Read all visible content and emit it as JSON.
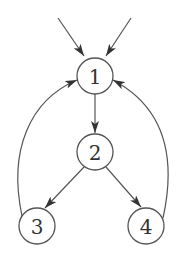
{
  "diagram": {
    "type": "directed-graph",
    "colors": {
      "stroke": "#555555",
      "label": "#333333",
      "background": "#ffffff"
    },
    "nodes": [
      {
        "id": "1",
        "label": "1",
        "x": 95,
        "y": 76
      },
      {
        "id": "2",
        "label": "2",
        "x": 95,
        "y": 152
      },
      {
        "id": "3",
        "label": "3",
        "x": 37,
        "y": 226
      },
      {
        "id": "4",
        "label": "4",
        "x": 146,
        "y": 226
      }
    ],
    "edges": [
      {
        "from": "external-left",
        "to": "1"
      },
      {
        "from": "external-right",
        "to": "1"
      },
      {
        "from": "1",
        "to": "2"
      },
      {
        "from": "2",
        "to": "3"
      },
      {
        "from": "2",
        "to": "4"
      },
      {
        "from": "3",
        "to": "1",
        "style": "curved"
      },
      {
        "from": "4",
        "to": "1",
        "style": "curved"
      }
    ]
  }
}
